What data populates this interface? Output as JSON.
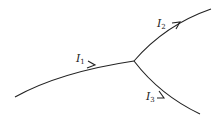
{
  "diagram": {
    "type": "current-junction",
    "stroke_color": "#222222",
    "background": "#ffffff",
    "branches": [
      {
        "id": "I1",
        "label_main": "I",
        "label_sub": "1",
        "direction": "into-junction"
      },
      {
        "id": "I2",
        "label_main": "I",
        "label_sub": "2",
        "direction": "out-of-junction"
      },
      {
        "id": "I3",
        "label_main": "I",
        "label_sub": "3",
        "direction": "out-of-junction"
      }
    ]
  }
}
